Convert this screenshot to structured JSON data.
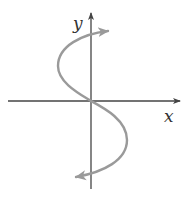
{
  "diagram": {
    "type": "graph-sketch",
    "axes": {
      "x_label": "x",
      "y_label": "y",
      "color": "#444444"
    },
    "curve": {
      "color": "#9a9a9a",
      "shape": "S-curve passing through origin, bulging left above x-axis and right below x-axis, arrows at both ends",
      "start_arrow_direction": "up-right",
      "end_arrow_direction": "down-left"
    }
  }
}
